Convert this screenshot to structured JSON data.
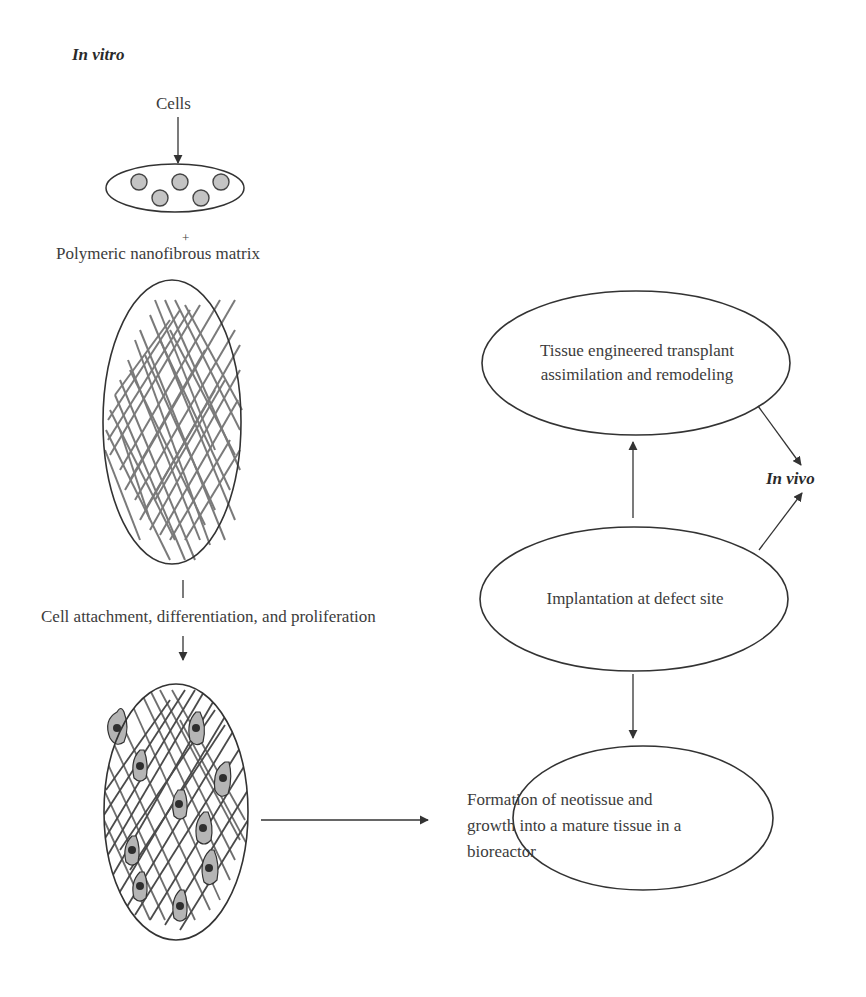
{
  "sections": {
    "in_vitro": "In vitro",
    "in_vivo": "In vivo"
  },
  "left_flow": {
    "cells_label": "Cells",
    "plus": "+",
    "matrix_label": "Polymeric nanofibrous matrix",
    "step_label": "Cell attachment, differentiation, and proliferation"
  },
  "nodes": {
    "transplant": [
      "Tissue engineered transplant",
      "assimilation and remodeling"
    ],
    "implantation": "Implantation at defect site",
    "formation": [
      "Formation of neotissue and",
      "growth into a mature tissue in a",
      "bioreactor"
    ]
  },
  "colors": {
    "stroke": "#333333",
    "fiber": "#7a7a7a",
    "cell_fill": "#c4c4c4",
    "cell_nucleus": "#3c3c3c"
  }
}
